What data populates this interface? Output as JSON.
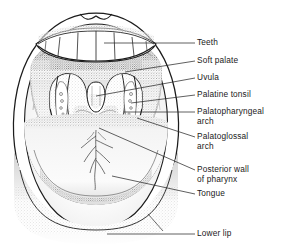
{
  "figure": {
    "ink_color": "#1c1c1c",
    "fill_color": "#fdfdfd",
    "shade_color": "#8a8a8a"
  },
  "labels": [
    {
      "id": "teeth",
      "text": "Teeth",
      "text2": ""
    },
    {
      "id": "soft-palate",
      "text": "Soft palate",
      "text2": ""
    },
    {
      "id": "uvula",
      "text": "Uvula",
      "text2": ""
    },
    {
      "id": "palatine-tonsil",
      "text": "Palatine tonsil",
      "text2": ""
    },
    {
      "id": "palatopharyngeal-arch",
      "text": "Palatopharyngeal",
      "text2": "arch"
    },
    {
      "id": "palatoglossal-arch",
      "text": "Palatoglossal",
      "text2": "arch"
    },
    {
      "id": "posterior-wall",
      "text": "Posterior wall",
      "text2": "of pharynx"
    },
    {
      "id": "tongue",
      "text": "Tongue",
      "text2": ""
    },
    {
      "id": "lower-lip",
      "text": "Lower lip",
      "text2": ""
    }
  ]
}
